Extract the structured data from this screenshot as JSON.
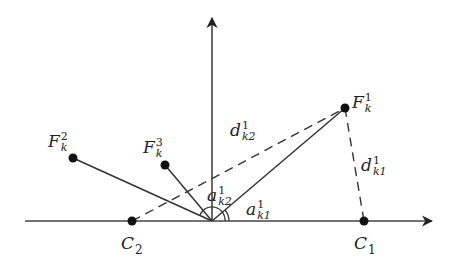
{
  "diagram": {
    "title": "",
    "colors": {
      "line": "#333333",
      "point": "#111111",
      "background": "#ffffff"
    },
    "axes": {
      "origin": [
        212,
        221
      ],
      "horizontal": {
        "x1": 25,
        "x2": 432,
        "y": 221
      },
      "vertical": {
        "x": 212,
        "y1": 221,
        "y2": 18
      }
    },
    "points": [
      {
        "id": "F1",
        "x": 345,
        "y": 108,
        "label_base": "F",
        "label_sup": "1",
        "label_sub": "k"
      },
      {
        "id": "F2",
        "x": 73,
        "y": 158,
        "label_base": "F",
        "label_sup": "2",
        "label_sub": "k"
      },
      {
        "id": "F3",
        "x": 165,
        "y": 165,
        "label_base": "F",
        "label_sup": "3",
        "label_sub": "k"
      },
      {
        "id": "C2",
        "x": 132,
        "y": 221,
        "label_base": "C",
        "label_sub": "2"
      },
      {
        "id": "C1",
        "x": 364,
        "y": 221,
        "label_base": "C",
        "label_sub": "1"
      }
    ],
    "labels": {
      "F1": {
        "base": "F",
        "sup": "1",
        "sub": "k"
      },
      "F2": {
        "base": "F",
        "sup": "2",
        "sub": "k"
      },
      "F3": {
        "base": "F",
        "sup": "3",
        "sub": "k"
      },
      "C1": {
        "base": "C",
        "sub": "1"
      },
      "C2": {
        "base": "C",
        "sub": "2"
      },
      "d_k2": {
        "base": "d",
        "sup": "1",
        "sub": "k2"
      },
      "d_k1": {
        "base": "d",
        "sup": "1",
        "sub": "k1"
      },
      "a_k2": {
        "base": "a",
        "sup": "1",
        "sub": "k2"
      },
      "a_k1": {
        "base": "a",
        "sup": "1",
        "sub": "k1"
      }
    },
    "solid_segments": [
      {
        "from": "O",
        "to": "F1"
      },
      {
        "from": "O",
        "to": "F2"
      },
      {
        "from": "O",
        "to": "F3"
      }
    ],
    "dashed_segments": [
      {
        "from": "C2",
        "to": "F1",
        "label": "d_k2"
      },
      {
        "from": "F1",
        "to": "C1",
        "label": "d_k1"
      }
    ],
    "angles": [
      {
        "label": "a_k1",
        "between": [
          "horizontal-axis",
          "O-F1"
        ]
      },
      {
        "label": "a_k2",
        "between": [
          "horizontal-axis",
          "O-F2"
        ]
      }
    ]
  }
}
